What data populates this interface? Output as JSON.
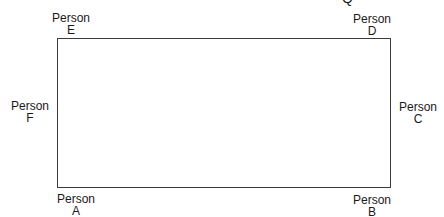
{
  "diagram": {
    "type": "seating-arrangement",
    "shape": "rectangle",
    "partial_top_glyph": "Q",
    "people": [
      {
        "id": "A",
        "label": "Person",
        "letter": "A",
        "position": "bottom-left corner"
      },
      {
        "id": "B",
        "label": "Person",
        "letter": "B",
        "position": "bottom-right corner"
      },
      {
        "id": "C",
        "label": "Person",
        "letter": "C",
        "position": "right side middle"
      },
      {
        "id": "D",
        "label": "Person",
        "letter": "D",
        "position": "top-right corner"
      },
      {
        "id": "E",
        "label": "Person",
        "letter": "E",
        "position": "top-left corner"
      },
      {
        "id": "F",
        "label": "Person",
        "letter": "F",
        "position": "left side middle"
      }
    ]
  }
}
